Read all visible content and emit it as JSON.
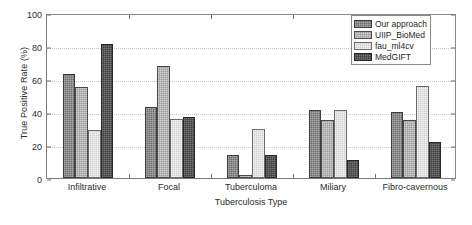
{
  "chart_data": {
    "type": "bar",
    "title": "",
    "xlabel": "Tuberculosis Type",
    "ylabel": "True Positive Rate (%)",
    "categories": [
      "Infiltrative",
      "Focal",
      "Tuberculoma",
      "Miliary",
      "Fibro-cavernous"
    ],
    "ylim": [
      0,
      100
    ],
    "yticks": [
      0,
      20,
      40,
      60,
      80,
      100
    ],
    "ytick_labels": [
      "0",
      "20",
      "40",
      "60",
      "80",
      "100"
    ],
    "grid": true,
    "legend_position": "top-right",
    "series": [
      {
        "name": "Our approach",
        "color": "#6e6e6e",
        "values": [
          63,
          43,
          14,
          41,
          40
        ]
      },
      {
        "name": "UIIP_BioMed",
        "color": "#9a9a9a",
        "values": [
          55,
          68,
          2,
          35,
          35
        ]
      },
      {
        "name": "fau_ml4cv",
        "color": "#cfcfcf",
        "values": [
          29,
          36,
          30,
          41,
          56
        ]
      },
      {
        "name": "MedGIFT",
        "color": "#3f3f3f",
        "values": [
          81,
          37,
          14,
          11,
          22
        ]
      }
    ]
  }
}
